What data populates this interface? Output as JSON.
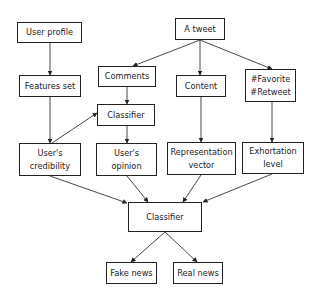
{
  "diagram": {
    "type": "flowchart",
    "title": "",
    "nodes": [
      {
        "id": "user_profile",
        "lines": [
          "User profile"
        ]
      },
      {
        "id": "a_tweet",
        "lines": [
          "A tweet"
        ]
      },
      {
        "id": "features_set",
        "lines": [
          "Features set"
        ]
      },
      {
        "id": "comments",
        "lines": [
          "Comments"
        ]
      },
      {
        "id": "content",
        "lines": [
          "Content"
        ]
      },
      {
        "id": "favorite_retweet",
        "lines": [
          "#Favorite",
          "#Retweet"
        ]
      },
      {
        "id": "classifier_mid",
        "lines": [
          "Classifier"
        ]
      },
      {
        "id": "users_credibility",
        "lines": [
          "User's",
          "credibility"
        ]
      },
      {
        "id": "users_opinion",
        "lines": [
          "User's",
          "opinion"
        ]
      },
      {
        "id": "representation_vector",
        "lines": [
          "Representation",
          "vector"
        ]
      },
      {
        "id": "exhortation_level",
        "lines": [
          "Exhortation",
          "level"
        ]
      },
      {
        "id": "classifier_final",
        "lines": [
          "Classifier"
        ]
      },
      {
        "id": "fake_news",
        "lines": [
          "Fake news"
        ]
      },
      {
        "id": "real_news",
        "lines": [
          "Real news"
        ]
      }
    ],
    "edges": [
      {
        "from": "user_profile",
        "to": "features_set"
      },
      {
        "from": "features_set",
        "to": "users_credibility"
      },
      {
        "from": "users_credibility",
        "to": "classifier_mid"
      },
      {
        "from": "a_tweet",
        "to": "comments"
      },
      {
        "from": "a_tweet",
        "to": "content"
      },
      {
        "from": "a_tweet",
        "to": "favorite_retweet"
      },
      {
        "from": "comments",
        "to": "classifier_mid"
      },
      {
        "from": "classifier_mid",
        "to": "users_opinion"
      },
      {
        "from": "content",
        "to": "representation_vector"
      },
      {
        "from": "favorite_retweet",
        "to": "exhortation_level"
      },
      {
        "from": "users_credibility",
        "to": "classifier_final"
      },
      {
        "from": "users_opinion",
        "to": "classifier_final"
      },
      {
        "from": "representation_vector",
        "to": "classifier_final"
      },
      {
        "from": "exhortation_level",
        "to": "classifier_final"
      },
      {
        "from": "classifier_final",
        "to": "fake_news"
      },
      {
        "from": "classifier_final",
        "to": "real_news"
      }
    ],
    "colors": {
      "stroke": "#222222",
      "background": "#ffffff",
      "text": "#222222"
    }
  }
}
